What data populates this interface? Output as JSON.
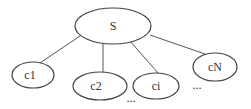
{
  "diagram": {
    "type": "tree",
    "root": {
      "id": "S",
      "label": "S"
    },
    "children": [
      {
        "id": "c1",
        "label": "c1"
      },
      {
        "id": "c2",
        "label": "c2"
      },
      {
        "id": "ci",
        "label": "ci"
      },
      {
        "id": "cN",
        "label": "cN"
      }
    ],
    "ellipses": [
      "...",
      "..."
    ],
    "colors": {
      "stroke": "#444444",
      "background": "#ffffff",
      "text": "#333333"
    }
  }
}
